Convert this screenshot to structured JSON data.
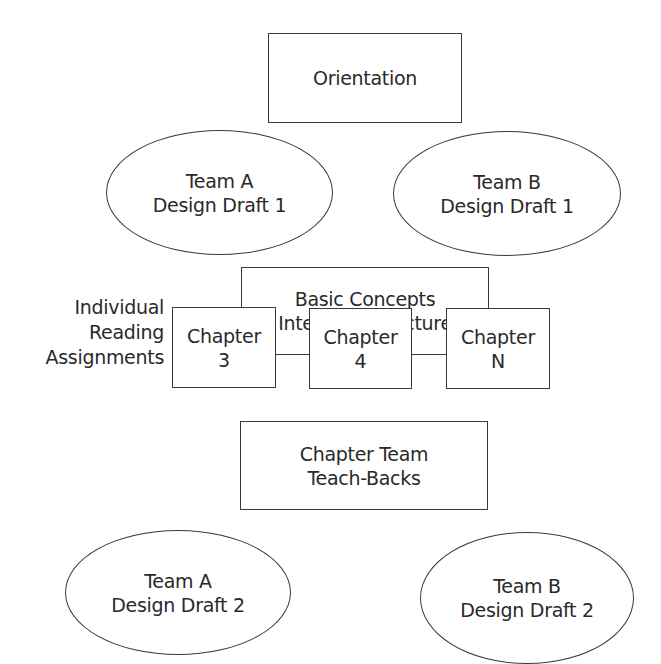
{
  "diagram": {
    "orientation": {
      "lines": [
        "Orientation"
      ]
    },
    "draft1": {
      "team_a": {
        "lines": [
          "Team A",
          "Design Draft 1"
        ]
      },
      "team_b": {
        "lines": [
          "Team B",
          "Design Draft 1"
        ]
      }
    },
    "basic_concepts": {
      "lines": [
        "Basic Concepts",
        "Interactive Lecture"
      ]
    },
    "reading_label": {
      "lines": [
        "Individual",
        "Reading",
        "Assignments"
      ]
    },
    "chapters": [
      {
        "lines": [
          "Chapter",
          "3"
        ]
      },
      {
        "lines": [
          "Chapter",
          "4"
        ]
      },
      {
        "lines": [
          "Chapter",
          "N"
        ]
      }
    ],
    "teach_backs": {
      "lines": [
        "Chapter Team",
        "Teach-Backs"
      ]
    },
    "draft2": {
      "team_a": {
        "lines": [
          "Team A",
          "Design Draft 2"
        ]
      },
      "team_b": {
        "lines": [
          "Team B",
          "Design Draft 2"
        ]
      }
    }
  },
  "colors": {
    "stroke": "#3a3a3a",
    "text": "#2a2a2a",
    "background": "#ffffff"
  }
}
